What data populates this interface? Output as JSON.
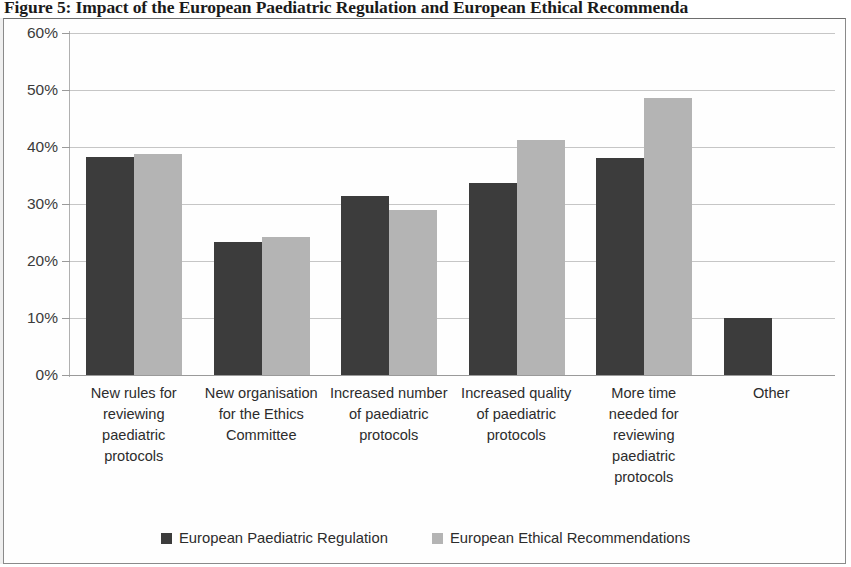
{
  "figure": {
    "caption": "Figure 5: Impact of the European Paediatric Regulation and European Ethical Recommenda"
  },
  "legend": {
    "position": "bottom",
    "entries": [
      {
        "label": "European Paediatric Regulation",
        "color": "#3c3c3c"
      },
      {
        "label": "European Ethical Recommendations",
        "color": "#b4b4b4"
      }
    ]
  },
  "axis": {
    "y_ticks": [
      "60%",
      "50%",
      "40%",
      "30%",
      "20%",
      "10%",
      "0%"
    ]
  },
  "chart_data": {
    "type": "bar",
    "title": "Figure 5: Impact of the European Paediatric Regulation and European Ethical Recommenda",
    "xlabel": "",
    "ylabel": "",
    "ylim": [
      0,
      60
    ],
    "ytick_values": [
      0,
      10,
      20,
      30,
      40,
      50,
      60
    ],
    "ytick_labels": [
      "0%",
      "10%",
      "20%",
      "30%",
      "40%",
      "50%",
      "60%"
    ],
    "grid": true,
    "legend_position": "bottom",
    "categories": [
      "New rules for reviewing paediatric protocols",
      "New organisation for the Ethics Committee",
      "Increased number of paediatric protocols",
      "Increased quality of paediatric protocols",
      "More time needed for reviewing paediatric protocols",
      "Other"
    ],
    "category_lines": [
      [
        "New rules for",
        "reviewing",
        "paediatric",
        "protocols"
      ],
      [
        "New organisation",
        "for the Ethics",
        "Committee"
      ],
      [
        "Increased number",
        "of paediatric",
        "protocols"
      ],
      [
        "Increased quality",
        "of paediatric",
        "protocols"
      ],
      [
        "More time",
        "needed for",
        "reviewing",
        "paediatric",
        "protocols"
      ],
      [
        "Other"
      ]
    ],
    "series": [
      {
        "name": "European Paediatric Regulation",
        "color": "#3c3c3c",
        "values": [
          38.2,
          23.4,
          31.4,
          33.6,
          38.0,
          10.0
        ]
      },
      {
        "name": "European Ethical Recommendations",
        "color": "#b4b4b4",
        "values": [
          38.8,
          24.2,
          28.9,
          41.2,
          48.6,
          0
        ]
      }
    ]
  }
}
